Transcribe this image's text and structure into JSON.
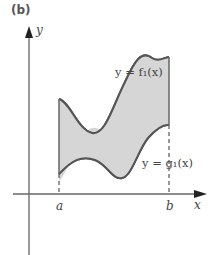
{
  "panel": {
    "label": "(b)"
  },
  "axes": {
    "x_label": "x",
    "y_label": "y"
  },
  "ticks": {
    "a": "a",
    "b": "b"
  },
  "curves": {
    "upper": {
      "label": "y = f₁(x)"
    },
    "lower": {
      "label": "y = g₁(x)"
    }
  },
  "colors": {
    "fill": "#d6d6d6",
    "curve": "#555555",
    "axis": "#555555"
  }
}
